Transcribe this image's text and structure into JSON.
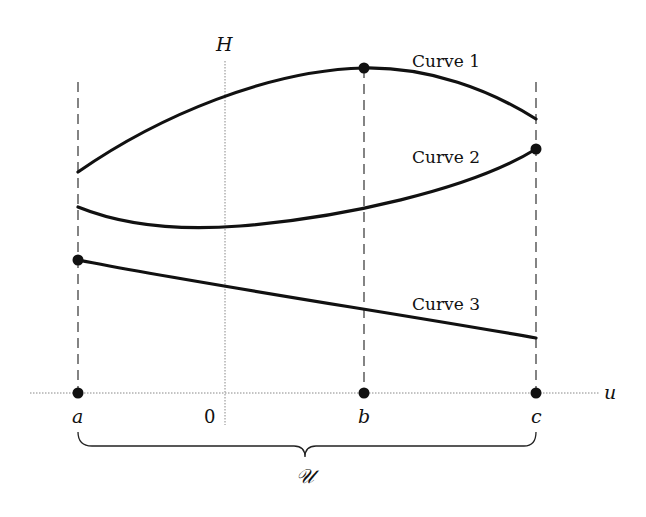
{
  "diagram": {
    "axes": {
      "horizontal_label": "u",
      "vertical_label": "H",
      "origin_label": "0"
    },
    "points": [
      {
        "id": "a",
        "label": "a",
        "x": 78
      },
      {
        "id": "b",
        "label": "b",
        "x": 364
      },
      {
        "id": "c",
        "label": "c",
        "x": 536
      }
    ],
    "curves": [
      {
        "id": "curve1",
        "label": "Curve 1",
        "marked_point": "maximum at b"
      },
      {
        "id": "curve2",
        "label": "Curve 2",
        "marked_point": "maximum at c"
      },
      {
        "id": "curve3",
        "label": "Curve 3",
        "marked_point": "maximum at a"
      }
    ],
    "brace_label": "𝒰",
    "colors": {
      "ink": "#111111",
      "axis": "#888888",
      "background": "#ffffff"
    }
  }
}
